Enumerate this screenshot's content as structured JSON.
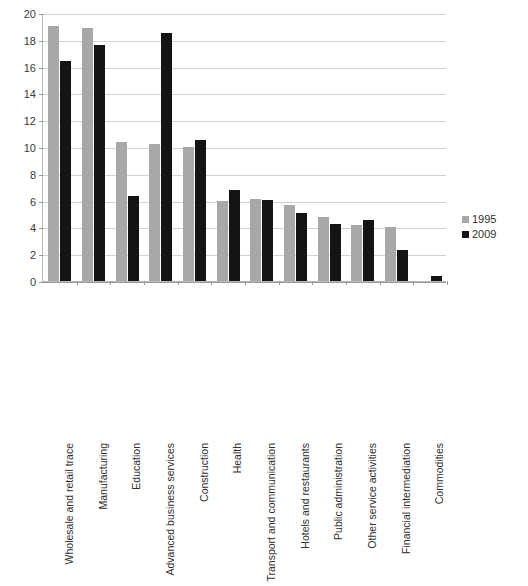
{
  "chart_data": {
    "type": "bar",
    "title": "",
    "xlabel": "",
    "ylabel": "",
    "ylim": [
      0,
      20
    ],
    "ytick_step": 2,
    "yticks": [
      "20",
      "18",
      "16",
      "14",
      "12",
      "10",
      "8",
      "6",
      "4",
      "2",
      "0"
    ],
    "grid": true,
    "legend_position": "right",
    "categories": [
      "Wholesale and retail trace",
      "Manufacturing",
      "Education",
      "Advanced business services",
      "Construction",
      "Health",
      "Transport and communication",
      "Hotels and restaurants",
      "Public administration",
      "Other service activities",
      "Financial intermediation",
      "Commodities"
    ],
    "series": [
      {
        "name": "1995",
        "color": "#a8a8a8",
        "values": [
          19.0,
          18.85,
          10.4,
          10.25,
          10.0,
          5.95,
          6.1,
          5.65,
          4.8,
          4.2,
          4.0,
          0
        ]
      },
      {
        "name": "2009",
        "color": "#141414",
        "values": [
          16.4,
          17.65,
          6.35,
          18.5,
          10.55,
          6.8,
          6.05,
          5.1,
          4.25,
          4.55,
          2.3,
          0.4
        ]
      }
    ]
  },
  "legend": {
    "items": [
      {
        "label": "1995",
        "color": "#a8a8a8"
      },
      {
        "label": "2009",
        "color": "#141414"
      }
    ]
  }
}
